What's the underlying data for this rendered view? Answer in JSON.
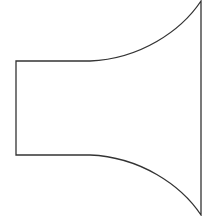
{
  "diagram": {
    "stroke_color": "#333333",
    "stroke_width": 1.3,
    "fill_color": "#ffffff",
    "background": "#ffffff",
    "shape": {
      "throat_left_x": 16,
      "throat_top_y": 61,
      "throat_bottom_y": 155,
      "straight_end_x": 90,
      "mouth_x": 201,
      "mouth_top_y": 1,
      "mouth_bottom_y": 215
    }
  }
}
